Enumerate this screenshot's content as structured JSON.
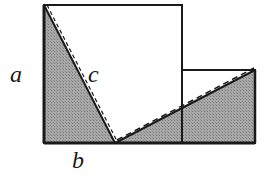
{
  "diagram": {
    "labels": {
      "a": "a",
      "b": "b",
      "c": "c"
    },
    "colors": {
      "stroke": "#1a1a1a",
      "shade": "#9a9a9a",
      "background": "#ffffff"
    },
    "shapes": {
      "large_square": [
        [
          44,
          5
        ],
        [
          182,
          5
        ],
        [
          182,
          143
        ],
        [
          44,
          143
        ]
      ],
      "small_square": [
        [
          182,
          70
        ],
        [
          255,
          70
        ],
        [
          255,
          143
        ],
        [
          182,
          143
        ]
      ],
      "left_triangle": [
        [
          44,
          5
        ],
        [
          44,
          143
        ],
        [
          115,
          143
        ]
      ],
      "right_triangle": [
        [
          115,
          143
        ],
        [
          255,
          70
        ],
        [
          255,
          143
        ]
      ],
      "dashed_lines": [
        [
          [
            44,
            5
          ],
          [
            115,
            143
          ]
        ],
        [
          [
            115,
            143
          ],
          [
            255,
            70
          ]
        ]
      ]
    }
  }
}
